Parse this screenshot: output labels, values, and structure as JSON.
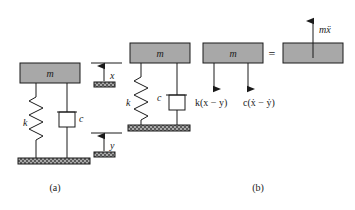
{
  "figure": {
    "captions": {
      "a": "(a)",
      "b": "(b)"
    },
    "equals_sign": "=",
    "panel_a": {
      "mass_label": "m",
      "spring_label": "k",
      "damper_label": "c",
      "coordinate_x": "x",
      "coordinate_y": "y"
    },
    "panel_b": {
      "mass_label_left": "m",
      "mass_label_right": "m",
      "spring_label": "k",
      "damper_label": "c",
      "spring_force_label": "k(x − y)",
      "damper_force_label": "c(ẋ − ẏ)",
      "inertia_force_label": "mẍ"
    },
    "colors": {
      "mass_fill": "#a8a8a8",
      "mass_stroke": "#1a1a1a",
      "line": "#1a1a1a",
      "ground_fill": "#4d4d4d",
      "ground_hatch": "#9a9a9a",
      "background": "#ffffff",
      "text": "#1a1a1a"
    }
  },
  "icons": {
    "spring": "spring-coil-icon",
    "damper": "dashpot-icon",
    "ground": "ground-hatch-icon",
    "arrow_up": "arrow-up-icon",
    "arrow_down": "arrow-down-icon"
  }
}
